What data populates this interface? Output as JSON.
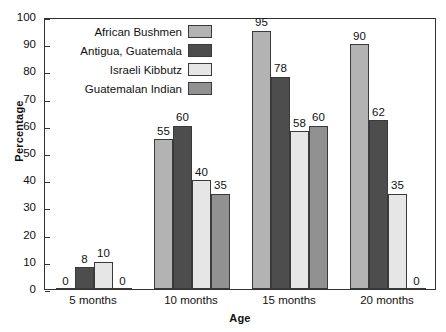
{
  "chart_data": {
    "type": "bar",
    "title": "",
    "xlabel": "Age",
    "ylabel": "Percentage",
    "categories": [
      "5 months",
      "10 months",
      "15 months",
      "20 months"
    ],
    "ylim": [
      0,
      100
    ],
    "yticks": [
      0,
      10,
      20,
      30,
      40,
      50,
      60,
      70,
      80,
      90,
      100
    ],
    "grid": false,
    "legend_position": "top-left-inside",
    "series": [
      {
        "name": "African Bushmen",
        "color": "#b3b3b3",
        "values": [
          0,
          55,
          95,
          90
        ]
      },
      {
        "name": "Antigua, Guatemala",
        "color": "#4d4d4d",
        "values": [
          8,
          60,
          78,
          62
        ]
      },
      {
        "name": "Israeli Kibbutz",
        "color": "#e6e6e6",
        "values": [
          10,
          40,
          58,
          35
        ]
      },
      {
        "name": "Guatemalan Indian",
        "color": "#919191",
        "values": [
          0,
          35,
          60,
          0
        ]
      }
    ]
  }
}
